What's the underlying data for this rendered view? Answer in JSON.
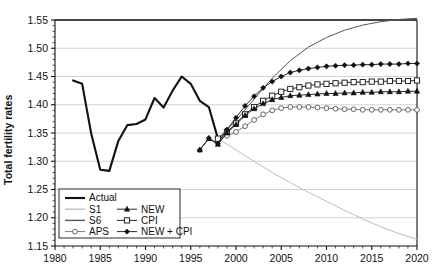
{
  "chart_data": {
    "type": "line",
    "title": "",
    "xlabel": "",
    "ylabel": "Total fertility rates",
    "xlim": [
      1980,
      2020
    ],
    "ylim": [
      1.15,
      1.55
    ],
    "xticks": [
      1980,
      1985,
      1990,
      1995,
      2000,
      2005,
      2010,
      2015,
      2020
    ],
    "xticklabels": [
      "1980",
      "1985",
      "1990",
      "1995",
      "2000",
      "2005",
      "2010",
      "2015",
      "2020"
    ],
    "yticks": [
      1.15,
      1.2,
      1.25,
      1.3,
      1.35,
      1.4,
      1.45,
      1.5,
      1.55
    ],
    "yticklabels": [
      "1.15",
      "1.20",
      "1.25",
      "1.30",
      "1.35",
      "1.40",
      "1.45",
      "1.50",
      "1.55"
    ],
    "grid": "horizontal",
    "legend_position": "lower-left-inside",
    "series": [
      {
        "name": "Actual",
        "style": "thick-solid-black",
        "color": "#111111",
        "marker": "none",
        "x": [
          1982,
          1983,
          1984,
          1985,
          1986,
          1987,
          1988,
          1989,
          1990,
          1991,
          1992,
          1993,
          1994,
          1995,
          1996,
          1997,
          1998
        ],
        "y": [
          1.443,
          1.437,
          1.349,
          1.285,
          1.283,
          1.336,
          1.364,
          1.366,
          1.374,
          1.412,
          1.395,
          1.425,
          1.45,
          1.437,
          1.407,
          1.396,
          1.34
        ]
      },
      {
        "name": "S1",
        "style": "thin-solid-light-gray",
        "color": "#b4b4b4",
        "marker": "none",
        "x": [
          1998,
          2000,
          2002,
          2004,
          2006,
          2008,
          2010,
          2012,
          2014,
          2016,
          2018,
          2020
        ],
        "y": [
          1.34,
          1.32,
          1.3,
          1.28,
          1.262,
          1.245,
          1.229,
          1.213,
          1.198,
          1.184,
          1.172,
          1.162
        ]
      },
      {
        "name": "S6",
        "style": "thin-solid-dark-gray",
        "color": "#555555",
        "marker": "none",
        "x": [
          1998,
          2000,
          2002,
          2004,
          2006,
          2008,
          2010,
          2012,
          2014,
          2016,
          2018,
          2020
        ],
        "y": [
          1.34,
          1.372,
          1.41,
          1.447,
          1.478,
          1.502,
          1.519,
          1.532,
          1.541,
          1.547,
          1.551,
          1.553
        ]
      },
      {
        "name": "APS",
        "style": "thin-solid-open-circle",
        "color": "#555555",
        "marker": "open-circle",
        "x": [
          1998,
          1999,
          2000,
          2001,
          2002,
          2003,
          2004,
          2005,
          2006,
          2007,
          2008,
          2009,
          2010,
          2011,
          2012,
          2013,
          2014,
          2015,
          2016,
          2017,
          2018,
          2019,
          2020
        ],
        "y": [
          1.34,
          1.345,
          1.352,
          1.362,
          1.373,
          1.383,
          1.39,
          1.394,
          1.396,
          1.396,
          1.396,
          1.395,
          1.394,
          1.393,
          1.392,
          1.392,
          1.391,
          1.391,
          1.391,
          1.391,
          1.391,
          1.391,
          1.391
        ]
      },
      {
        "name": "NEW",
        "style": "solid-filled-triangle",
        "color": "#111111",
        "marker": "filled-triangle",
        "x": [
          1996,
          1997,
          1998,
          1999,
          2000,
          2001,
          2002,
          2003,
          2004,
          2005,
          2006,
          2007,
          2008,
          2009,
          2010,
          2011,
          2012,
          2013,
          2014,
          2015,
          2016,
          2017,
          2018,
          2019,
          2020
        ],
        "y": [
          1.32,
          1.34,
          1.33,
          1.35,
          1.365,
          1.381,
          1.393,
          1.402,
          1.409,
          1.413,
          1.416,
          1.417,
          1.418,
          1.419,
          1.42,
          1.42,
          1.421,
          1.421,
          1.422,
          1.422,
          1.423,
          1.423,
          1.423,
          1.424,
          1.424
        ]
      },
      {
        "name": "CPI",
        "style": "solid-open-square",
        "color": "#111111",
        "marker": "open-square",
        "x": [
          1998,
          1999,
          2000,
          2001,
          2002,
          2003,
          2004,
          2005,
          2006,
          2007,
          2008,
          2009,
          2010,
          2011,
          2012,
          2013,
          2014,
          2015,
          2016,
          2017,
          2018,
          2019,
          2020
        ],
        "y": [
          1.34,
          1.352,
          1.367,
          1.383,
          1.396,
          1.407,
          1.416,
          1.423,
          1.428,
          1.431,
          1.434,
          1.436,
          1.437,
          1.438,
          1.439,
          1.44,
          1.44,
          1.441,
          1.441,
          1.442,
          1.442,
          1.442,
          1.443
        ]
      },
      {
        "name": "NEW + CPI",
        "style": "solid-filled-diamond",
        "color": "#111111",
        "marker": "filled-diamond",
        "x": [
          1996,
          1997,
          1998,
          1999,
          2000,
          2001,
          2002,
          2003,
          2004,
          2005,
          2006,
          2007,
          2008,
          2009,
          2010,
          2011,
          2012,
          2013,
          2014,
          2015,
          2016,
          2017,
          2018,
          2019,
          2020
        ],
        "y": [
          1.32,
          1.341,
          1.331,
          1.356,
          1.377,
          1.398,
          1.415,
          1.43,
          1.441,
          1.45,
          1.457,
          1.461,
          1.464,
          1.466,
          1.468,
          1.469,
          1.47,
          1.47,
          1.471,
          1.471,
          1.472,
          1.472,
          1.472,
          1.473,
          1.473
        ]
      }
    ],
    "legend": [
      {
        "label": "Actual",
        "key": "actual"
      },
      {
        "label": "S1",
        "key": "s1"
      },
      {
        "label": "S6",
        "key": "s6"
      },
      {
        "label": "APS",
        "key": "aps"
      },
      {
        "label": "NEW",
        "key": "new"
      },
      {
        "label": "CPI",
        "key": "cpi"
      },
      {
        "label": "NEW + CPI",
        "key": "new_cpi"
      }
    ]
  },
  "colors": {
    "axis": "#111111",
    "grid": "#c8c8c8",
    "actual": "#111111",
    "s1": "#b4b4b4",
    "s6": "#555555",
    "aps": "#555555",
    "background": "#ffffff"
  }
}
